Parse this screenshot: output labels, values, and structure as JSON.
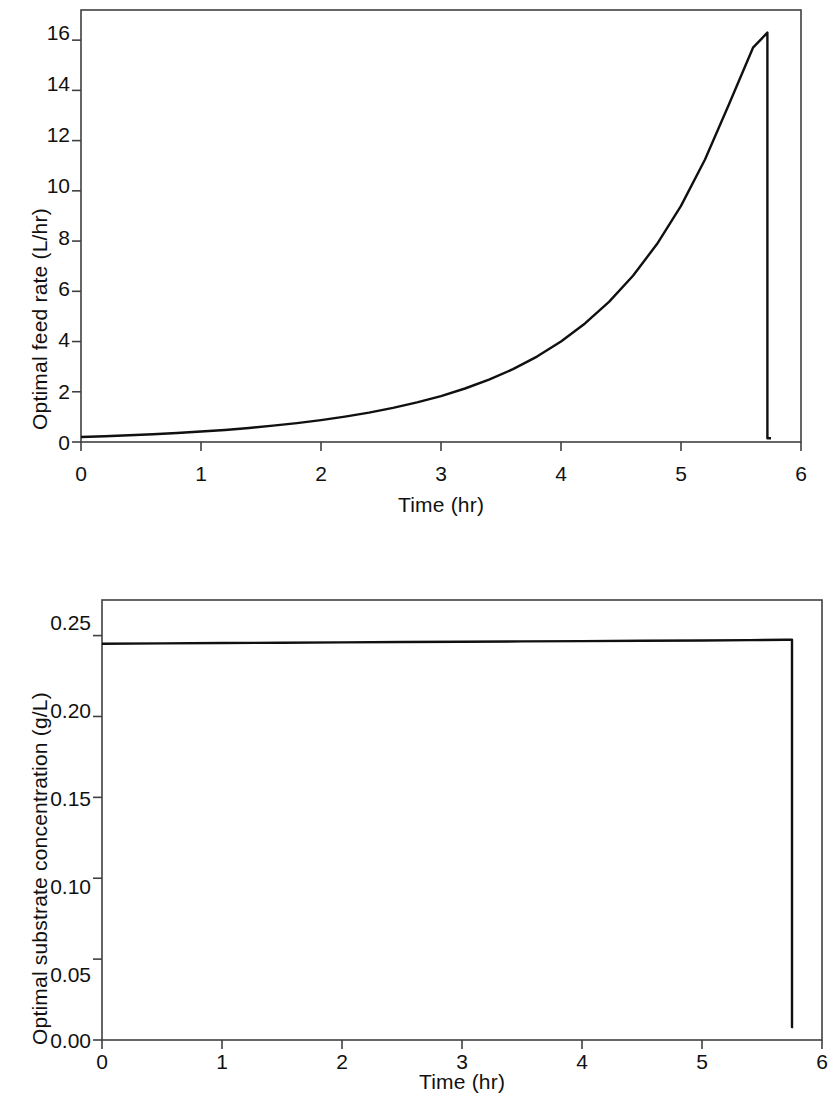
{
  "figure": {
    "panels": [
      {
        "id": "feed-rate",
        "x_axis_title": "Time (hr)",
        "y_axis_title": "Optimal feed rate (L/hr)",
        "x_tick_labels": [
          "0",
          "1",
          "2",
          "3",
          "4",
          "5",
          "6"
        ],
        "y_tick_labels": [
          "0",
          "2",
          "4",
          "6",
          "8",
          "10",
          "12",
          "14",
          "16"
        ]
      },
      {
        "id": "substrate",
        "x_axis_title": "Time (hr)",
        "y_axis_title": "Optimal substrate concentration (g/L)",
        "x_tick_labels": [
          "0",
          "1",
          "2",
          "3",
          "4",
          "5",
          "6"
        ],
        "y_tick_labels": [
          "0.00",
          "0.05",
          "0.10",
          "0.15",
          "0.20",
          "0.25"
        ]
      }
    ],
    "line_color": "#101010",
    "axis_color": "#404040"
  },
  "chart_data": [
    {
      "type": "line",
      "title": "",
      "xlabel": "Time (hr)",
      "ylabel": "Optimal feed rate (L/hr)",
      "xlim": [
        0,
        6
      ],
      "ylim": [
        0,
        17.2
      ],
      "xticks": [
        0,
        1,
        2,
        3,
        4,
        5,
        6
      ],
      "yticks": [
        0,
        2,
        4,
        6,
        8,
        10,
        12,
        14,
        16
      ],
      "grid": false,
      "legend": "none",
      "series": [
        {
          "name": "Optimal feed rate",
          "x": [
            0.0,
            0.2,
            0.4,
            0.6,
            0.8,
            1.0,
            1.2,
            1.4,
            1.6,
            1.8,
            2.0,
            2.2,
            2.4,
            2.6,
            2.8,
            3.0,
            3.2,
            3.4,
            3.6,
            3.8,
            4.0,
            4.2,
            4.4,
            4.6,
            4.8,
            5.0,
            5.2,
            5.4,
            5.6,
            5.72,
            5.72,
            5.75
          ],
          "y": [
            0.2,
            0.23,
            0.27,
            0.31,
            0.36,
            0.42,
            0.48,
            0.56,
            0.65,
            0.75,
            0.87,
            1.01,
            1.17,
            1.36,
            1.58,
            1.83,
            2.13,
            2.48,
            2.9,
            3.4,
            4.0,
            4.72,
            5.58,
            6.62,
            7.88,
            9.4,
            11.25,
            13.45,
            15.7,
            16.3,
            0.15,
            0.15
          ]
        }
      ],
      "annotations": [
        "Monotonic exponential rise from about 0.2 L/hr at t = 0 hr to a peak of about 16.3 L/hr at t = 5.72 hr, followed by an abrupt vertical drop to about 0.15 L/hr."
      ]
    },
    {
      "type": "line",
      "title": "",
      "xlabel": "Time (hr)",
      "ylabel": "Optimal substrate concentration (g/L)",
      "xlim": [
        0,
        6
      ],
      "ylim": [
        0,
        0.272
      ],
      "xticks": [
        0,
        1,
        2,
        3,
        4,
        5,
        6
      ],
      "yticks": [
        0.0,
        0.05,
        0.1,
        0.15,
        0.2,
        0.25
      ],
      "grid": false,
      "legend": "none",
      "series": [
        {
          "name": "Optimal substrate concentration",
          "x": [
            0.0,
            0.5,
            1.0,
            1.5,
            2.0,
            2.5,
            3.0,
            3.5,
            4.0,
            4.5,
            5.0,
            5.4,
            5.7,
            5.75,
            5.75,
            5.76
          ],
          "y": [
            0.245,
            0.2452,
            0.2454,
            0.2456,
            0.2458,
            0.246,
            0.2462,
            0.2464,
            0.2466,
            0.2468,
            0.247,
            0.2472,
            0.2474,
            0.2475,
            0.008,
            0.008
          ]
        }
      ],
      "annotations": [
        "Essentially constant at about 0.245 g/L from t = 0 hr through t = 5.75 hr, then a sharp vertical drop to about 0.008 g/L."
      ]
    }
  ]
}
